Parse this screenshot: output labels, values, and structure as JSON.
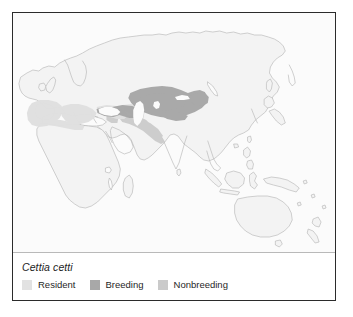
{
  "figure": {
    "kind": "species-range-map",
    "frame_color": "#2b2b2b",
    "background_color": "#ffffff"
  },
  "map": {
    "name": "world-range-map",
    "projection_extent": "Europe, Africa, Asia, Australasia",
    "ocean_color": "#fbfbfb",
    "land_fill": "#f2f2f2",
    "coastline_color": "#b0b0b0"
  },
  "legend": {
    "species": "Cettia cetti",
    "items": [
      {
        "label": "Resident",
        "color": "#e2e2e2",
        "swatch_name": "resident-swatch"
      },
      {
        "label": "Breeding",
        "color": "#a8a8a8",
        "swatch_name": "breeding-swatch"
      },
      {
        "label": "Nonbreeding",
        "color": "#cacaca",
        "swatch_name": "nonbreeding-swatch"
      }
    ]
  },
  "range_data": {
    "resident_color": "#e2e2e2",
    "breeding_color": "#a8a8a8",
    "nonbreeding_color": "#cacaca",
    "regions": [
      {
        "status": "Resident",
        "area": "Iberian Peninsula, Mediterranean Basin, North Africa, Italy, Balkans, Turkey"
      },
      {
        "status": "Breeding",
        "area": "Central Asia, Caspian basin, Kazakhstan, Xinjiang"
      },
      {
        "status": "Nonbreeding",
        "area": "Middle East, Iran, Afghanistan, Northwest India"
      }
    ]
  }
}
